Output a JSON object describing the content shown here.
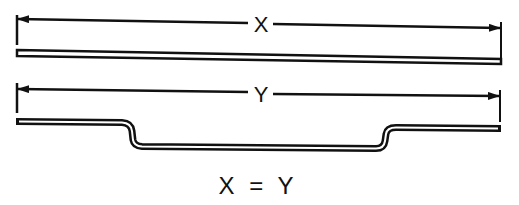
{
  "diagram": {
    "colors": {
      "ink": "#111111",
      "background": "#ffffff"
    },
    "dimension_x": {
      "label": "X",
      "description": "overall length of straight bar"
    },
    "dimension_y": {
      "label": "Y",
      "description": "overall length of bent (offset) bar"
    },
    "bars": [
      {
        "name": "straight-bar",
        "shape": "straight"
      },
      {
        "name": "bent-bar",
        "shape": "offset with two bends"
      }
    ],
    "caption": "X = Y"
  }
}
